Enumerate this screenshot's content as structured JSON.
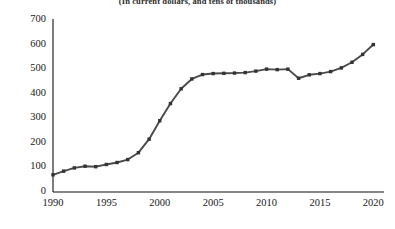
{
  "subtitle": "(In current dollars, and tens of thousands)",
  "axes": {
    "y_ticks": [
      "0",
      "100",
      "200",
      "300",
      "400",
      "500",
      "600",
      "700"
    ],
    "x_ticks": [
      "1990",
      "1995",
      "2000",
      "2005",
      "2010",
      "2015",
      "2020"
    ]
  },
  "style": {
    "line_color": "#4a4a4a",
    "marker_color": "#333333",
    "axis_color": "#111111",
    "background": "#ffffff"
  },
  "chart_data": {
    "type": "line",
    "title": "",
    "subtitle": "(In current dollars, and tens of thousands)",
    "xlabel": "",
    "ylabel": "",
    "xlim": [
      1990,
      2021
    ],
    "ylim": [
      0,
      700
    ],
    "grid": false,
    "legend": "none",
    "markers": "square",
    "x": [
      1990,
      1991,
      1992,
      1993,
      1994,
      1995,
      1996,
      1997,
      1998,
      1999,
      2000,
      2001,
      2002,
      2003,
      2004,
      2005,
      2006,
      2007,
      2008,
      2009,
      2010,
      2011,
      2012,
      2013,
      2014,
      2015,
      2016,
      2017,
      2018,
      2019,
      2020
    ],
    "values": [
      70,
      85,
      98,
      105,
      103,
      112,
      120,
      132,
      160,
      215,
      290,
      360,
      420,
      460,
      478,
      482,
      483,
      484,
      486,
      492,
      500,
      498,
      500,
      463,
      477,
      482,
      490,
      505,
      528,
      560,
      600
    ],
    "series": [
      {
        "name": "value",
        "values": [
          70,
          85,
          98,
          105,
          103,
          112,
          120,
          132,
          160,
          215,
          290,
          360,
          420,
          460,
          478,
          482,
          483,
          484,
          486,
          492,
          500,
          498,
          500,
          463,
          477,
          482,
          490,
          505,
          528,
          560,
          600
        ]
      }
    ]
  },
  "plot_geometry": {
    "x_axis_pixel": 53,
    "baseline_pixel": 192,
    "top_pixel": 20,
    "right_pixel": 384
  }
}
